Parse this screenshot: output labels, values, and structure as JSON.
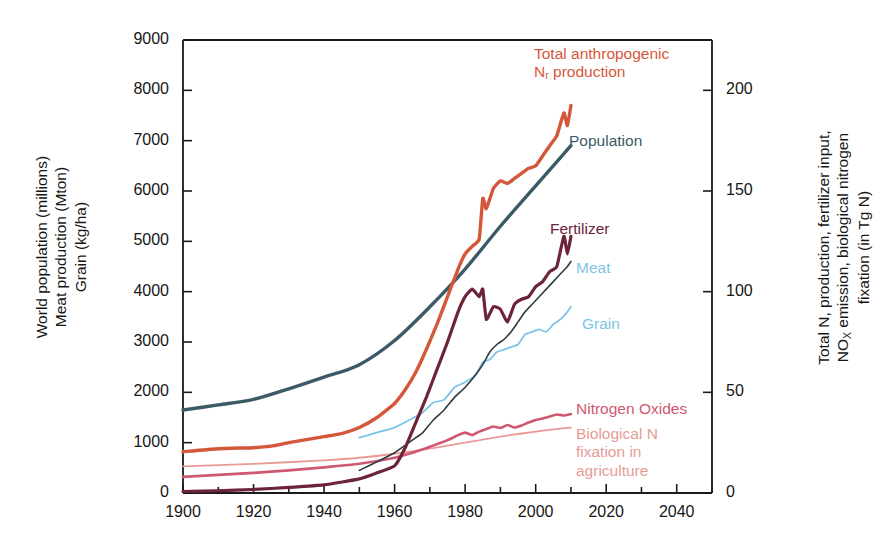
{
  "chart_data": {
    "type": "line",
    "title": "",
    "xlabel": "",
    "ylabel_left": "World population (millions)\nMeat production (Mton)\nGrain (kg/ha)",
    "ylabel_right": "Total N, production, fertilizer input,\nNOx emission, biological nitrogen\nfixation (in Tg N)",
    "xlim": [
      1900,
      2050
    ],
    "xticks": [
      1900,
      1920,
      1940,
      1960,
      1980,
      2000,
      2020,
      2040
    ],
    "xtick_labels": [
      "1900",
      "1920",
      "1940",
      "1960",
      "1980",
      "2000",
      "2020",
      "2040"
    ],
    "xminor_step": 10,
    "ylim_left": [
      0,
      9000
    ],
    "yticks_left": [
      0,
      1000,
      2000,
      3000,
      4000,
      5000,
      6000,
      7000,
      8000,
      9000
    ],
    "ytick_labels_left": [
      "0",
      "1000",
      "2000",
      "3000",
      "4000",
      "5000",
      "6000",
      "7000",
      "8000",
      "9000"
    ],
    "ylim_right": [
      0,
      225
    ],
    "yticks_right": [
      0,
      50,
      100,
      150,
      200
    ],
    "ytick_labels_right": [
      "0",
      "50",
      "100",
      "150",
      "200"
    ],
    "grid": false,
    "legend": "inline-annotations",
    "series": [
      {
        "name": "Total anthropogenic Nr production",
        "label": "Total anthropogenic\nNᵣ production",
        "axis": "left",
        "color": "#D4573A",
        "width": 3.4,
        "x": [
          1900,
          1910,
          1920,
          1925,
          1930,
          1935,
          1940,
          1945,
          1950,
          1955,
          1960,
          1963,
          1966,
          1969,
          1972,
          1975,
          1978,
          1980,
          1982,
          1984,
          1985,
          1986,
          1988,
          1990,
          1992,
          1994,
          1996,
          1998,
          2000,
          2002,
          2004,
          2006,
          2008,
          2009,
          2010
        ],
        "y": [
          820,
          880,
          900,
          930,
          1000,
          1060,
          1120,
          1180,
          1300,
          1500,
          1780,
          2050,
          2400,
          2850,
          3350,
          3900,
          4450,
          4750,
          4900,
          5050,
          5850,
          5650,
          6050,
          6200,
          6150,
          6250,
          6350,
          6450,
          6500,
          6700,
          6900,
          7100,
          7550,
          7300,
          7700
        ]
      },
      {
        "name": "Population",
        "label": "Population",
        "axis": "left",
        "color": "#3B5A66",
        "width": 3.4,
        "x": [
          1900,
          1910,
          1920,
          1930,
          1940,
          1950,
          1960,
          1970,
          1980,
          1990,
          2000,
          2010
        ],
        "y": [
          1650,
          1750,
          1860,
          2070,
          2300,
          2550,
          3030,
          3700,
          4450,
          5300,
          6100,
          6900
        ]
      },
      {
        "name": "Fertilizer",
        "label": "Fertilizer",
        "axis": "left",
        "color": "#6C2438",
        "width": 3.2,
        "x": [
          1900,
          1910,
          1920,
          1930,
          1940,
          1950,
          1955,
          1960,
          1963,
          1966,
          1969,
          1972,
          1975,
          1978,
          1980,
          1982,
          1984,
          1985,
          1986,
          1988,
          1990,
          1992,
          1994,
          1996,
          1998,
          2000,
          2002,
          2004,
          2006,
          2008,
          2009,
          2010
        ],
        "y": [
          30,
          45,
          70,
          110,
          160,
          280,
          400,
          540,
          900,
          1400,
          1900,
          2450,
          3000,
          3600,
          3900,
          4050,
          3900,
          4050,
          3450,
          3700,
          3650,
          3400,
          3750,
          3850,
          3900,
          4100,
          4200,
          4400,
          4500,
          5100,
          4750,
          5100
        ]
      },
      {
        "name": "Meat",
        "label": "Meat",
        "axis": "left",
        "color": "#2E3B45",
        "width": 1.6,
        "x": [
          1950,
          1955,
          1960,
          1965,
          1968,
          1971,
          1974,
          1977,
          1980,
          1983,
          1985,
          1987,
          1989,
          1991,
          1993,
          1995,
          1997,
          1999,
          2001,
          2003,
          2005,
          2007,
          2009,
          2010
        ],
        "y": [
          450,
          620,
          800,
          1050,
          1200,
          1450,
          1650,
          1900,
          2100,
          2350,
          2550,
          2800,
          2950,
          3050,
          3200,
          3400,
          3600,
          3750,
          3900,
          4050,
          4200,
          4350,
          4500,
          4600
        ]
      },
      {
        "name": "Grain",
        "label": "Grain",
        "axis": "left",
        "color": "#7EC3E8",
        "width": 1.8,
        "x": [
          1950,
          1955,
          1960,
          1965,
          1968,
          1971,
          1974,
          1977,
          1980,
          1983,
          1985,
          1987,
          1989,
          1991,
          1993,
          1995,
          1997,
          1999,
          2001,
          2003,
          2005,
          2007,
          2009,
          2010
        ],
        "y": [
          1100,
          1200,
          1300,
          1480,
          1600,
          1800,
          1850,
          2100,
          2200,
          2350,
          2600,
          2650,
          2800,
          2850,
          2900,
          2950,
          3150,
          3200,
          3250,
          3200,
          3350,
          3450,
          3600,
          3700
        ]
      },
      {
        "name": "Nitrogen Oxides",
        "label": "Nitrogen Oxides",
        "axis": "left",
        "color": "#CF5870",
        "width": 2.6,
        "x": [
          1900,
          1910,
          1920,
          1930,
          1940,
          1950,
          1960,
          1965,
          1970,
          1975,
          1978,
          1980,
          1982,
          1984,
          1986,
          1988,
          1990,
          1992,
          1994,
          1996,
          1998,
          2000,
          2002,
          2004,
          2006,
          2008,
          2010
        ],
        "y": [
          320,
          360,
          400,
          450,
          510,
          580,
          700,
          800,
          920,
          1050,
          1150,
          1200,
          1150,
          1220,
          1270,
          1320,
          1290,
          1350,
          1300,
          1340,
          1400,
          1450,
          1480,
          1520,
          1560,
          1540,
          1570
        ]
      },
      {
        "name": "Biological N fixation in agriculture",
        "label": "Biological N\nfixation in\nagriculture",
        "axis": "left",
        "color": "#E89B96",
        "width": 1.8,
        "x": [
          1900,
          1920,
          1940,
          1950,
          1960,
          1970,
          1980,
          1990,
          2000,
          2010
        ],
        "y": [
          530,
          580,
          650,
          700,
          780,
          880,
          1000,
          1120,
          1220,
          1300
        ]
      }
    ]
  },
  "annotations": {
    "total_nr": {
      "text": "Total anthropogenic\nNᵣ production",
      "color": "#D4573A"
    },
    "population": {
      "text": "Population",
      "color": "#3B5A66"
    },
    "fertilizer": {
      "text": "Fertilizer",
      "color": "#6C2438"
    },
    "meat": {
      "text": "Meat",
      "color": "#7EC3E8"
    },
    "grain": {
      "text": "Grain",
      "color": "#7EC3E8"
    },
    "nitrogen_oxides": {
      "text": "Nitrogen Oxides",
      "color": "#CF5870"
    },
    "biological_n": {
      "text": "Biological N\nfixation in\nagriculture",
      "color": "#E89B96"
    }
  }
}
